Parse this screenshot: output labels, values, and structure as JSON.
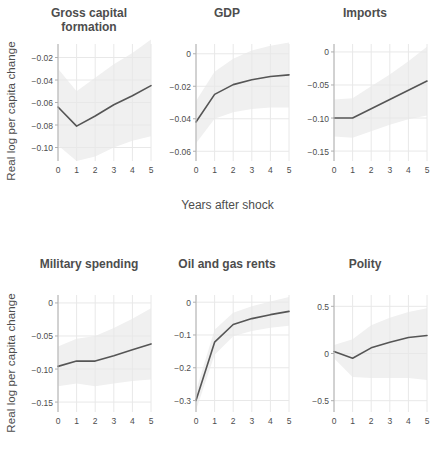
{
  "figure": {
    "ylabel": "Real log per capita change",
    "xlabel": "Years after shock",
    "line_color": "#555555",
    "band_color": "#f0f0f0",
    "grid_color": "#e8e8e8",
    "axis_color": "#b0b0b0",
    "text_color": "#4d4d4d"
  },
  "chart_data": [
    {
      "type": "line",
      "title": "Gross capital formation",
      "xlabel": "Years after shock",
      "ylabel": "Real log per capita change",
      "x": [
        0,
        1,
        2,
        3,
        4,
        5
      ],
      "values": [
        -0.064,
        -0.081,
        -0.072,
        -0.062,
        -0.054,
        -0.045
      ],
      "band_lower": [
        -0.098,
        -0.112,
        -0.108,
        -0.1,
        -0.094,
        -0.09
      ],
      "band_upper": [
        -0.03,
        -0.05,
        -0.038,
        -0.026,
        -0.016,
        -0.004
      ],
      "ylim": [
        -0.112,
        -0.008
      ],
      "yticks": [
        -0.02,
        -0.04,
        -0.06,
        -0.08,
        -0.1
      ],
      "yticklabels": [
        "−0.02",
        "−0.04",
        "−0.06",
        "−0.08",
        "−0.10"
      ],
      "xticks": [
        0,
        1,
        2,
        3,
        4,
        5
      ],
      "xticklabels": [
        "0",
        "1",
        "2",
        "3",
        "4",
        "5"
      ],
      "grid": true,
      "legend": "none"
    },
    {
      "type": "line",
      "title": "GDP",
      "xlabel": "Years after shock",
      "ylabel": "Real log per capita change",
      "x": [
        0,
        1,
        2,
        3,
        4,
        5
      ],
      "values": [
        -0.042,
        -0.025,
        -0.019,
        -0.016,
        -0.014,
        -0.013
      ],
      "band_lower": [
        -0.055,
        -0.04,
        -0.036,
        -0.034,
        -0.033,
        -0.033
      ],
      "band_upper": [
        -0.029,
        -0.011,
        -0.003,
        0.002,
        0.005,
        0.007
      ],
      "ylim": [
        -0.066,
        0.006
      ],
      "yticks": [
        0,
        -0.02,
        -0.04,
        -0.06
      ],
      "yticklabels": [
        "0",
        "−0.02",
        "−0.04",
        "−0.06"
      ],
      "xticks": [
        0,
        1,
        2,
        3,
        4,
        5
      ],
      "xticklabels": [
        "0",
        "1",
        "2",
        "3",
        "4",
        "5"
      ],
      "grid": true,
      "legend": "none"
    },
    {
      "type": "line",
      "title": "Imports",
      "xlabel": "Years after shock",
      "ylabel": "Real log per capita change",
      "x": [
        0,
        1,
        2,
        3,
        4,
        5
      ],
      "values": [
        -0.1,
        -0.1,
        -0.086,
        -0.072,
        -0.058,
        -0.044
      ],
      "band_lower": [
        -0.128,
        -0.13,
        -0.12,
        -0.11,
        -0.102,
        -0.096
      ],
      "band_upper": [
        -0.072,
        -0.07,
        -0.052,
        -0.034,
        -0.014,
        0.008
      ],
      "ylim": [
        -0.165,
        0.012
      ],
      "yticks": [
        0,
        -0.05,
        -0.1,
        -0.15
      ],
      "yticklabels": [
        "0",
        "−0.05",
        "−0.10",
        "−0.15"
      ],
      "xticks": [
        0,
        1,
        2,
        3,
        4,
        5
      ],
      "xticklabels": [
        "0",
        "1",
        "2",
        "3",
        "4",
        "5"
      ],
      "grid": true,
      "legend": "none"
    },
    {
      "type": "line",
      "title": "Military spending",
      "xlabel": "Years after shock",
      "ylabel": "Real log per capita change",
      "x": [
        0,
        1,
        2,
        3,
        4,
        5
      ],
      "values": [
        -0.096,
        -0.088,
        -0.088,
        -0.08,
        -0.071,
        -0.062
      ],
      "band_lower": [
        -0.126,
        -0.122,
        -0.126,
        -0.122,
        -0.118,
        -0.116
      ],
      "band_upper": [
        -0.066,
        -0.054,
        -0.05,
        -0.038,
        -0.024,
        -0.008
      ],
      "ylim": [
        -0.165,
        0.012
      ],
      "yticks": [
        0,
        -0.05,
        -0.1,
        -0.15
      ],
      "yticklabels": [
        "0",
        "−0.05",
        "−0.10",
        "−0.15"
      ],
      "xticks": [
        0,
        1,
        2,
        3,
        4,
        5
      ],
      "xticklabels": [
        "0",
        "1",
        "2",
        "3",
        "4",
        "5"
      ],
      "grid": true,
      "legend": "none"
    },
    {
      "type": "line",
      "title": "Oil and gas rents",
      "xlabel": "Years after shock",
      "ylabel": "Real log per capita change",
      "x": [
        0,
        1,
        2,
        3,
        4,
        5
      ],
      "values": [
        -0.3,
        -0.122,
        -0.068,
        -0.05,
        -0.038,
        -0.028
      ],
      "band_lower": [
        -0.33,
        -0.16,
        -0.104,
        -0.088,
        -0.078,
        -0.072
      ],
      "band_upper": [
        -0.27,
        -0.084,
        -0.032,
        -0.012,
        0.002,
        0.016
      ],
      "ylim": [
        -0.335,
        0.022
      ],
      "yticks": [
        0,
        -0.1,
        -0.2,
        -0.3
      ],
      "yticklabels": [
        "0",
        "−0.1",
        "−0.2",
        "−0.3"
      ],
      "xticks": [
        0,
        1,
        2,
        3,
        4,
        5
      ],
      "xticklabels": [
        "0",
        "1",
        "2",
        "3",
        "4",
        "5"
      ],
      "grid": true,
      "legend": "none"
    },
    {
      "type": "line",
      "title": "Polity",
      "xlabel": "Years after shock",
      "ylabel": "Real log per capita change",
      "x": [
        0,
        1,
        2,
        3,
        4,
        5
      ],
      "values": [
        0.02,
        -0.05,
        0.06,
        0.12,
        0.17,
        0.19
      ],
      "band_lower": [
        -0.05,
        -0.25,
        -0.26,
        -0.26,
        -0.26,
        -0.28
      ],
      "band_upper": [
        0.09,
        0.15,
        0.3,
        0.38,
        0.44,
        0.48
      ],
      "ylim": [
        -0.62,
        0.62
      ],
      "yticks": [
        0.5,
        0,
        -0.5
      ],
      "yticklabels": [
        "0.5",
        "0",
        "−0.5"
      ],
      "xticks": [
        0,
        1,
        2,
        3,
        4,
        5
      ],
      "xticklabels": [
        "0",
        "1",
        "2",
        "3",
        "4",
        "5"
      ],
      "grid": true,
      "legend": "none"
    }
  ]
}
